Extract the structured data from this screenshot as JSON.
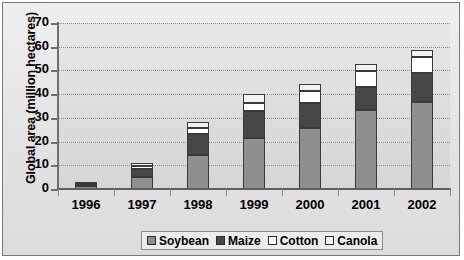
{
  "chart_data": {
    "type": "bar",
    "stacked": true,
    "title": "",
    "xlabel": "",
    "ylabel": "Global area (million hectares)",
    "ylim": [
      0,
      70
    ],
    "ytick_step": 10,
    "yticks": [
      70,
      60,
      50,
      40,
      30,
      20,
      10,
      0
    ],
    "grid": true,
    "grid_style": "dotted-horizontal",
    "legend_position": "bottom-center",
    "categories": [
      "1996",
      "1997",
      "1998",
      "1999",
      "2000",
      "2001",
      "2002"
    ],
    "series": [
      {
        "name": "Soybean",
        "color": "#8f8f8f",
        "values": [
          1.2,
          5.1,
          14.5,
          21.6,
          25.8,
          33.3,
          36.5
        ]
      },
      {
        "name": "Maize",
        "color": "#474747",
        "values": [
          0.6,
          3.2,
          8.7,
          11.1,
          10.3,
          9.8,
          12.4
        ]
      },
      {
        "name": "Cotton",
        "color": "#ffffff",
        "values": [
          0.4,
          1.4,
          2.5,
          3.7,
          5.3,
          6.8,
          6.8
        ]
      },
      {
        "name": "Canola",
        "color": "#f2f2f2",
        "values": [
          0.3,
          1.4,
          2.6,
          3.6,
          2.9,
          2.7,
          3.0
        ]
      }
    ],
    "totals": [
      2.5,
      11.1,
      28.3,
      40.0,
      44.3,
      52.6,
      58.7
    ]
  },
  "axis": {
    "y_title": "Global area (million hectares)"
  },
  "colors": {
    "plot_background": "#dedede",
    "frame_border": "#7a7a7a",
    "gridline": "#8e8e8e",
    "axis": "#707070",
    "bar_outline": "#3a3a3a"
  }
}
